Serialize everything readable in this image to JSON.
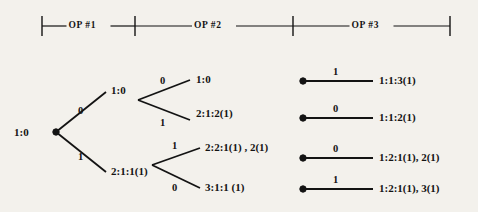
{
  "figure": {
    "type": "diagram",
    "subtype": "binary-decision-tree",
    "background_color": "#f3f1ec",
    "ink_color": "#131313"
  },
  "header": {
    "name": "operation-phase-ruler",
    "segments": [
      {
        "label": "OP  #1",
        "start_x": 42,
        "end_x": 135
      },
      {
        "label": "OP  #2",
        "start_x": 135,
        "end_x": 293
      },
      {
        "label": "OP  #3",
        "start_x": 293,
        "end_x": 450
      }
    ],
    "tick_x": [
      42,
      135,
      293,
      450
    ],
    "axis_y": 26,
    "tick_half_height": 10
  },
  "tree": {
    "root": {
      "name": "root-node",
      "label": "1:0",
      "label_x": 14,
      "label_y": 127,
      "dot_x": 56,
      "dot_y": 132
    },
    "level1": {
      "fork_from_x": 56,
      "fork_from_y": 132,
      "branches": [
        {
          "name": "branch-0",
          "edge_label": "0",
          "edge_label_x": 78,
          "edge_label_y": 106,
          "to_x": 106,
          "to_y": 92,
          "node_label": "1:0",
          "node_label_x": 111,
          "node_label_y": 85
        },
        {
          "name": "branch-1",
          "edge_label": "1",
          "edge_label_x": 78,
          "edge_label_y": 152,
          "to_x": 106,
          "to_y": 172,
          "node_label": "2:1:1(1)",
          "node_label_x": 111,
          "node_label_y": 166
        }
      ]
    },
    "level2": {
      "forks": [
        {
          "name": "fork-upper",
          "vertex_x": 138,
          "vertex_y": 100,
          "branches": [
            {
              "name": "branch-upper-0",
              "edge_label": "0",
              "edge_label_x": 160,
              "edge_label_y": 76,
              "to_x": 190,
              "to_y": 80,
              "node_label": "1:0",
              "node_label_x": 196,
              "node_label_y": 74
            },
            {
              "name": "branch-upper-1",
              "edge_label": "1",
              "edge_label_x": 160,
              "edge_label_y": 118,
              "to_x": 190,
              "to_y": 120,
              "node_label": "2:1:2(1)",
              "node_label_x": 196,
              "node_label_y": 108
            }
          ]
        },
        {
          "name": "fork-lower",
          "vertex_x": 152,
          "vertex_y": 165,
          "branches": [
            {
              "name": "branch-lower-1",
              "edge_label": "1",
              "edge_label_x": 172,
              "edge_label_y": 141,
              "to_x": 200,
              "to_y": 148,
              "node_label": "2:2:1(1) , 2(1)",
              "node_label_x": 205,
              "node_label_y": 142
            },
            {
              "name": "branch-lower-0",
              "edge_label": "0",
              "edge_label_x": 172,
              "edge_label_y": 183,
              "to_x": 200,
              "to_y": 188,
              "node_label": "3:1:1 (1)",
              "node_label_x": 205,
              "node_label_y": 182
            }
          ]
        }
      ]
    },
    "level3": {
      "rows": [
        {
          "name": "leaf-row-1",
          "dot_x": 303,
          "dot_y": 81,
          "line_to_x": 373,
          "edge_label": "1",
          "edge_label_x": 333,
          "edge_label_y": 67,
          "node_label": "1:1:3(1)",
          "node_label_x": 379,
          "node_label_y": 75
        },
        {
          "name": "leaf-row-2",
          "dot_x": 303,
          "dot_y": 118,
          "line_to_x": 373,
          "edge_label": "0",
          "edge_label_x": 333,
          "edge_label_y": 104,
          "node_label": "1:1:2(1)",
          "node_label_x": 379,
          "node_label_y": 112
        },
        {
          "name": "leaf-row-3",
          "dot_x": 303,
          "dot_y": 158,
          "line_to_x": 373,
          "edge_label": "0",
          "edge_label_x": 333,
          "edge_label_y": 144,
          "node_label": "1:2:1(1), 2(1)",
          "node_label_x": 379,
          "node_label_y": 152
        },
        {
          "name": "leaf-row-4",
          "dot_x": 303,
          "dot_y": 189,
          "line_to_x": 373,
          "edge_label": "1",
          "edge_label_x": 333,
          "edge_label_y": 175,
          "node_label": "1:2:1(1), 3(1)",
          "node_label_x": 379,
          "node_label_y": 183
        }
      ]
    }
  }
}
